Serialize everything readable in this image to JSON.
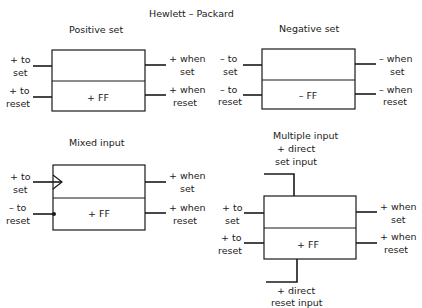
{
  "header": {
    "title": "Hewlett – Packard"
  },
  "diagrams": {
    "positive_set": {
      "title": "Positive set",
      "box_label": "+ FF",
      "inputs": [
        {
          "line1": "+ to",
          "line2": "set"
        },
        {
          "line1": "+ to",
          "line2": "reset"
        }
      ],
      "outputs": [
        {
          "line1": "+ when",
          "line2": "set"
        },
        {
          "line1": "+ when",
          "line2": "reset"
        }
      ]
    },
    "negative_set": {
      "title": "Negative set",
      "box_label": "– FF",
      "inputs": [
        {
          "line1": "– to",
          "line2": "set"
        },
        {
          "line1": "– to",
          "line2": "reset"
        }
      ],
      "outputs": [
        {
          "line1": "– when",
          "line2": "set"
        },
        {
          "line1": "– when",
          "line2": "reset"
        }
      ]
    },
    "mixed_input": {
      "title": "Mixed input",
      "box_label": "+ FF",
      "inputs": [
        {
          "line1": "+ to",
          "line2": "set",
          "marker": "arrow"
        },
        {
          "line1": "– to",
          "line2": "reset",
          "marker": "dot"
        }
      ],
      "outputs": [
        {
          "line1": "+ when",
          "line2": "set"
        },
        {
          "line1": "+ when",
          "line2": "reset"
        }
      ]
    },
    "multiple_input": {
      "title": "Multiple input",
      "box_label": "+ FF",
      "direct_set": {
        "line1": "+ direct",
        "line2": "set input"
      },
      "direct_reset": {
        "line1": "+ direct",
        "line2": "reset input"
      },
      "inputs": [
        {
          "line1": "+ to",
          "line2": "set"
        },
        {
          "line1": "+ to",
          "line2": "reset"
        }
      ],
      "outputs": [
        {
          "line1": "+ when",
          "line2": "set"
        },
        {
          "line1": "+ when",
          "line2": "reset"
        }
      ]
    }
  }
}
